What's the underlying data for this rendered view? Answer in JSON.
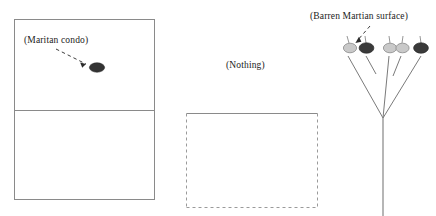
{
  "figure": {
    "type": "schematic-diagram",
    "width": 436,
    "height": 216,
    "background_color": "#ffffff",
    "line_color": "#6e6e6e",
    "text_color": "#1b1b1b"
  },
  "labels": {
    "condo": "(Maritan condo)",
    "nothing": "(Nothing)",
    "surface": "(Barren Martian surface)"
  },
  "panels": {
    "left": {
      "name": "solid-rectangle-panel",
      "x": 14,
      "y": 19,
      "width": 141,
      "height": 181,
      "border_style": "solid",
      "divider_y": 110,
      "marker": {
        "name": "dark-ellipse-marker",
        "cx": 97,
        "cy": 67,
        "rx": 7.5,
        "ry": 4.6,
        "fill": "#333333"
      },
      "arrow": {
        "name": "dashed-pointer-arrow",
        "x1": 56,
        "y1": 49,
        "x2": 88,
        "y2": 65,
        "style": "dashed"
      }
    },
    "middle": {
      "name": "dashed-rectangle-panel",
      "x": 186,
      "y": 113,
      "width": 132,
      "height": 95,
      "top_border_style": "solid",
      "side_border_style": "dashed",
      "bottom_border_style": "dashed"
    },
    "right": {
      "name": "branching-tree-panel",
      "trunk": {
        "x": 383,
        "y_top": 118,
        "y_bottom": 216
      },
      "arrow": {
        "name": "dashed-pointer-arrow",
        "x1": 367,
        "y1": 27,
        "x2": 355,
        "y2": 44,
        "style": "dashed"
      },
      "nodes": [
        {
          "id": "n1",
          "cx": 350,
          "cy": 48,
          "rx": 6.4,
          "ry": 4.6,
          "fill": "#c9c9c9",
          "stem_to_x": 365,
          "stem_to_y": 100
        },
        {
          "id": "n2",
          "cx": 366,
          "cy": 48,
          "rx": 7.2,
          "ry": 5.0,
          "fill": "#3a3a3a",
          "stem_to_x": 372,
          "stem_to_y": 86
        },
        {
          "id": "n3",
          "cx": 390,
          "cy": 48,
          "rx": 6.4,
          "ry": 4.6,
          "fill": "#c9c9c9",
          "stem_to_x": 383,
          "stem_to_y": 108
        },
        {
          "id": "n4",
          "cx": 402,
          "cy": 48,
          "rx": 6.4,
          "ry": 4.6,
          "fill": "#c9c9c9",
          "stem_to_x": 396,
          "stem_to_y": 84
        },
        {
          "id": "n5",
          "cx": 421,
          "cy": 48,
          "rx": 7.2,
          "ry": 5.0,
          "fill": "#3a3a3a",
          "stem_to_x": 400,
          "stem_to_y": 102
        }
      ],
      "branches": [
        {
          "id": "b1",
          "x1": 365,
          "y1": 100,
          "x2": 383,
          "y2": 118
        },
        {
          "id": "b2",
          "x1": 372,
          "y1": 86,
          "x2": 372,
          "y2": 86
        },
        {
          "id": "b3",
          "x1": 400,
          "y1": 102,
          "x2": 383,
          "y2": 118
        }
      ]
    }
  }
}
